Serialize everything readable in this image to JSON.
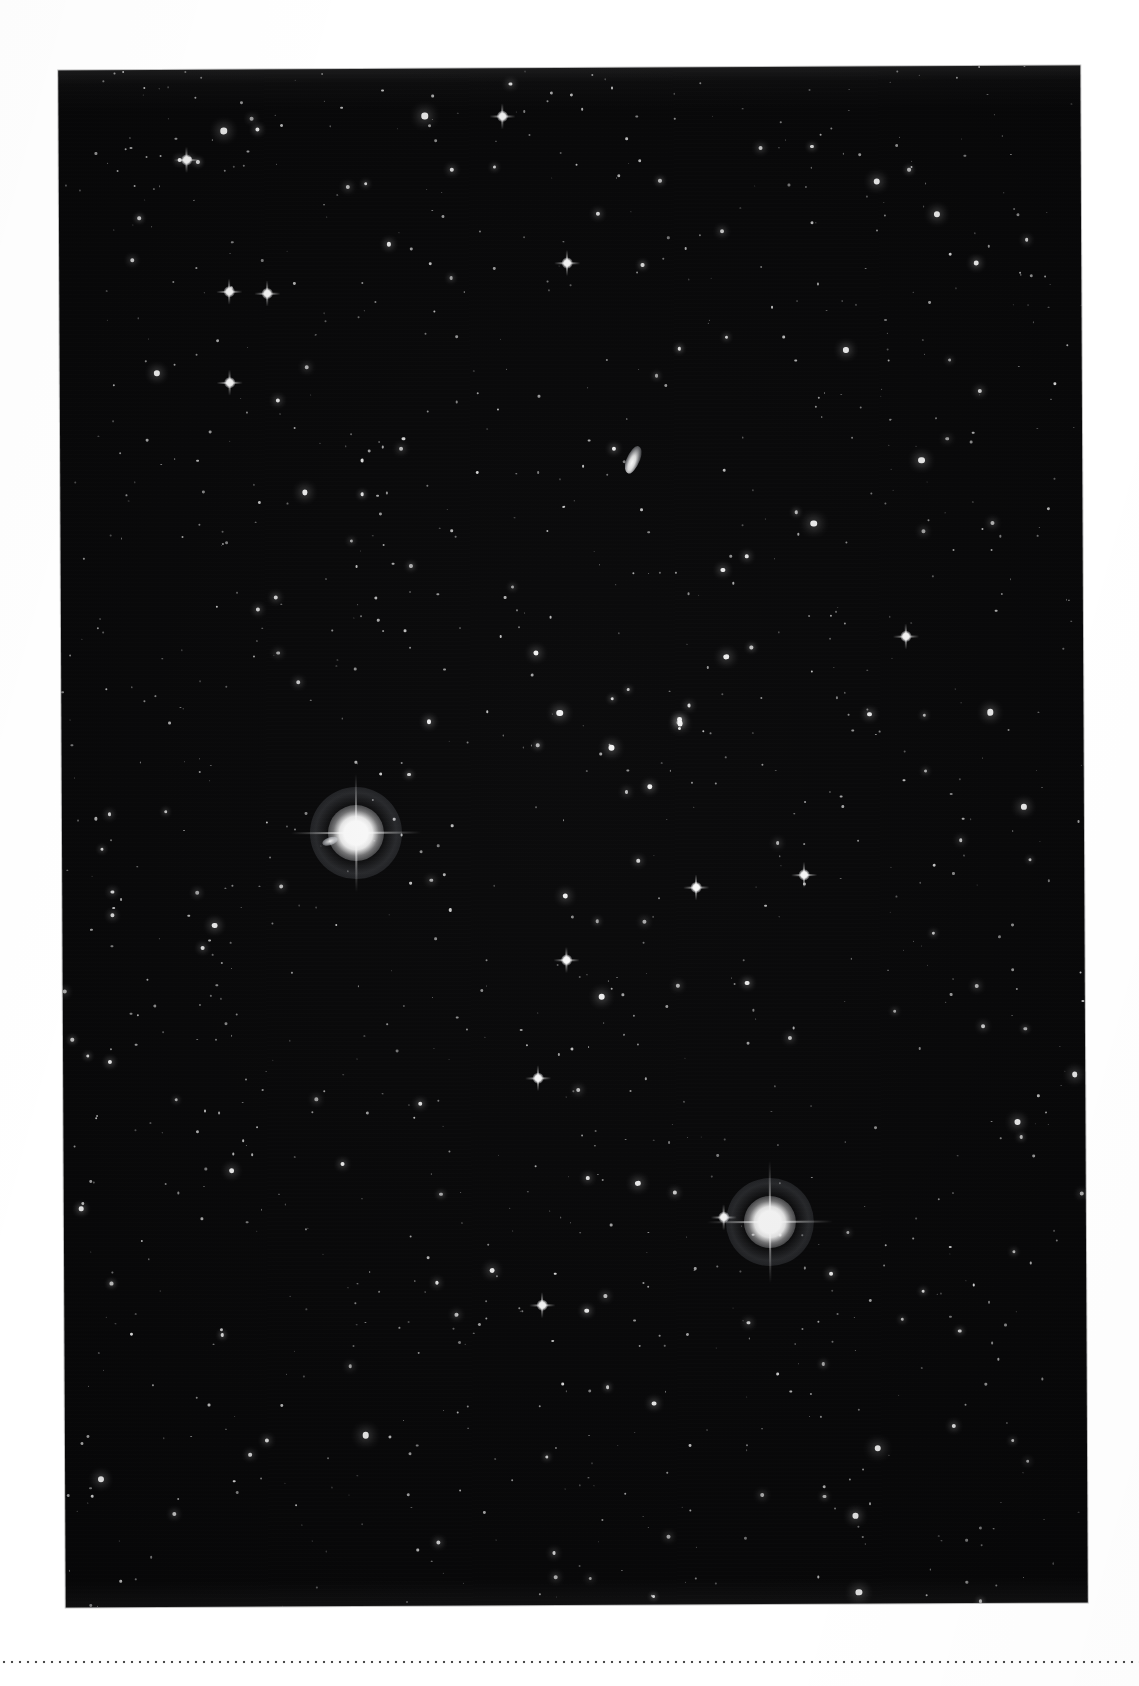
{
  "page": {
    "background_color": "#ffffff",
    "width": 1139,
    "height": 1686,
    "caption": ""
  },
  "plate": {
    "name": "star-field-photograph",
    "description": "Deep-sky star field photographic plate",
    "background_color": "#050506",
    "star_color": "#ffffff",
    "left": 62,
    "top": 68,
    "width": 1022,
    "height": 1537,
    "rotation_deg": -0.28
  },
  "bottom_rule": {
    "style": "dotted",
    "color": "#2b2b2b"
  },
  "features": {
    "bright_stars": [
      {
        "label": "bright-star-upper-left",
        "x": 294,
        "y": 764,
        "size": 34
      },
      {
        "label": "bright-star-lower-right",
        "x": 706,
        "y": 1155,
        "size": 32
      }
    ],
    "diffuse_object": {
      "label": "elongated-diffuse-object",
      "x": 573,
      "y": 392
    },
    "moderate_stars_count": 46,
    "faint_stars_count": 1100
  },
  "chart_data": {
    "type": "scatter",
    "title": "",
    "xlabel": "",
    "ylabel": "",
    "note": "Photographic star field; points are stellar images on the plate.",
    "stars": [
      {
        "x": 294,
        "y": 764,
        "mag": 1
      },
      {
        "x": 706,
        "y": 1155,
        "mag": 1
      },
      {
        "x": 573,
        "y": 392,
        "mag": 2
      },
      {
        "x": 170,
        "y": 222,
        "mag": 3
      },
      {
        "x": 208,
        "y": 224,
        "mag": 3
      },
      {
        "x": 128,
        "y": 90,
        "mag": 3
      },
      {
        "x": 170,
        "y": 313,
        "mag": 3
      },
      {
        "x": 508,
        "y": 195,
        "mag": 3
      },
      {
        "x": 444,
        "y": 48,
        "mag": 3
      },
      {
        "x": 504,
        "y": 892,
        "mag": 2
      },
      {
        "x": 478,
        "y": 1237,
        "mag": 3
      },
      {
        "x": 660,
        "y": 1150,
        "mag": 3
      },
      {
        "x": 480,
        "y": 1155,
        "mag": 3
      }
    ]
  }
}
